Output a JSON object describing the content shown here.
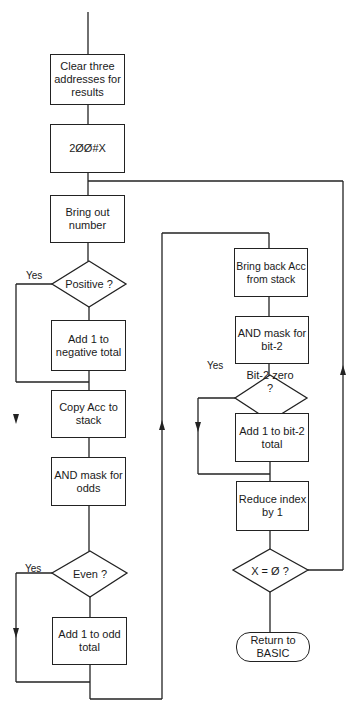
{
  "flowchart": {
    "left_column": {
      "clear_box": "Clear three addresses for results",
      "init_box": "2ØØ#X",
      "bring_out_box": "Bring out number",
      "positive_decision": "Positive ?",
      "positive_yes": "Yes",
      "negative_box": "Add 1 to negative total",
      "copy_box": "Copy Acc to stack",
      "odds_mask_box": "AND mask for odds",
      "even_decision": "Even ?",
      "even_yes": "Yes",
      "odd_total_box": "Add 1 to odd total"
    },
    "right_column": {
      "bring_back_box": "Bring back Acc from stack",
      "bit2_mask_box": "AND mask for bit-2",
      "bit2_decision": "Bit-2 zero ?",
      "bit2_yes": "Yes",
      "bit2_total_box": "Add 1 to bit-2 total",
      "reduce_box": "Reduce index by 1",
      "x_zero_decision": "X = Ø ?",
      "return_terminal": "Return to BASIC"
    }
  },
  "colors": {
    "line": "#222222",
    "background": "#ffffff"
  }
}
